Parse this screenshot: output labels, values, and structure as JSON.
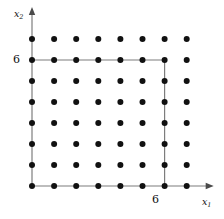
{
  "figure": {
    "title": "",
    "axes": {
      "x": {
        "label": "x",
        "subscript": "1",
        "arrow": true
      },
      "y": {
        "label": "x",
        "subscript": "2",
        "arrow": true
      }
    },
    "ticks": {
      "x": [
        {
          "value": 6,
          "label": "6"
        }
      ],
      "y": [
        {
          "value": 6,
          "label": "6"
        }
      ]
    },
    "colors": {
      "dot": "#111111",
      "axis_line": "#7d7d7d",
      "background": "#ffffff",
      "text": "#111111"
    }
  },
  "chart_data": {
    "type": "scatter",
    "title": "",
    "xlabel": "x1",
    "ylabel": "x2",
    "xlim": [
      0,
      7
    ],
    "ylim": [
      0,
      7
    ],
    "grid": false,
    "legend": null,
    "categories": [
      0,
      1,
      2,
      3,
      4,
      5,
      6,
      7
    ],
    "x": [
      0,
      1,
      2,
      3,
      4,
      5,
      6,
      7,
      0,
      1,
      2,
      3,
      4,
      5,
      6,
      7,
      0,
      1,
      2,
      3,
      4,
      5,
      6,
      7,
      0,
      1,
      2,
      3,
      4,
      5,
      6,
      7,
      0,
      1,
      2,
      3,
      4,
      5,
      6,
      7,
      0,
      1,
      2,
      3,
      4,
      5,
      6,
      7,
      0,
      1,
      2,
      3,
      4,
      5,
      6,
      7,
      0,
      1,
      2,
      3,
      4,
      5,
      6,
      7
    ],
    "y": [
      0,
      0,
      0,
      0,
      0,
      0,
      0,
      0,
      1,
      1,
      1,
      1,
      1,
      1,
      1,
      1,
      2,
      2,
      2,
      2,
      2,
      2,
      2,
      2,
      3,
      3,
      3,
      3,
      3,
      3,
      3,
      3,
      4,
      4,
      4,
      4,
      4,
      4,
      4,
      4,
      5,
      5,
      5,
      5,
      5,
      5,
      5,
      5,
      6,
      6,
      6,
      6,
      6,
      6,
      6,
      6,
      7,
      7,
      7,
      7,
      7,
      7,
      7,
      7
    ],
    "points_count": 64,
    "lines": [
      {
        "name": "x2-axis",
        "from": [
          0,
          0
        ],
        "to": [
          0,
          7
        ]
      },
      {
        "name": "x1-axis",
        "from": [
          0,
          0
        ],
        "to": [
          0,
          0
        ],
        "note": "horizontal base axis y=0"
      },
      {
        "name": "x2-equals-6",
        "from": [
          0,
          6
        ],
        "to": [
          6,
          6
        ]
      },
      {
        "name": "x1-equals-6",
        "from": [
          6,
          0
        ],
        "to": [
          6,
          6
        ]
      }
    ],
    "annotations": [
      {
        "text": "6",
        "axis": "y",
        "at": 6
      },
      {
        "text": "6",
        "axis": "x",
        "at": 6
      }
    ]
  },
  "geometry": {
    "origin_px": {
      "x": 32,
      "y": 186
    },
    "step_px": {
      "x": 22.1,
      "y": 21.0
    },
    "dot_radius_px": 3.0,
    "columns": 8,
    "rows": 8
  }
}
